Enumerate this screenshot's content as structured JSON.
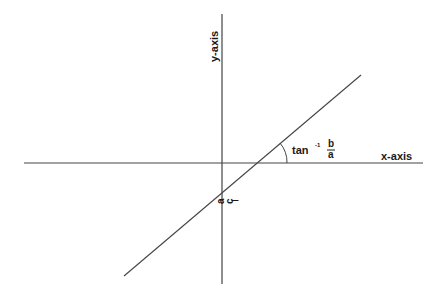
{
  "diagram": {
    "x_axis": {
      "label": "x-axis",
      "x1": 24,
      "y": 163,
      "x2": 423
    },
    "y_axis": {
      "label": "y-axis",
      "x": 222,
      "y1": 14,
      "y2": 284
    },
    "line": {
      "x1": 124,
      "y1": 276,
      "x2": 361,
      "y2": 75
    },
    "angle_label": {
      "func": "tan",
      "sup": "-1",
      "num": "b",
      "den": "a"
    },
    "intercept_label": {
      "num": "c",
      "den": "a"
    },
    "colors": {
      "line": "#444444",
      "text": "#1a1a1a",
      "background": "#ffffff"
    }
  }
}
